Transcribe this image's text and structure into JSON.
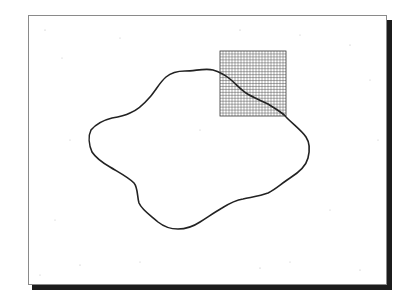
{
  "diagram": {
    "type": "region-with-sample-grid",
    "frame": {
      "x": 28,
      "y": 15,
      "width": 359,
      "height": 270,
      "border_color": "#8a8a8a",
      "shadow_color": "#1c1c1c"
    },
    "region": {
      "label": "irregular-region-outline",
      "stroke_color": "#222222",
      "stroke_width": 1.6,
      "path": "M213,70 C205,68 195,71 185,71 C178,71 172,72 166,77 C160,82 156,90 150,97 C144,104 138,110 130,113 C124,116 118,117 112,118 C104,120 96,124 91,130 C88,136 89,145 92,152 C96,158 103,163 110,167 C118,172 128,177 134,183 C138,188 137,196 139,203 C142,210 150,215 158,222 C163,226 170,229 178,229 C186,229 194,226 200,222 C208,217 215,212 222,208 C230,203 236,200 243,199 C252,197 260,196 268,193 C276,189 282,183 290,178 C298,173 306,166 308,158 C310,150 310,143 306,137 C302,131 294,125 287,118 C284,115 283,113 284,115 C280,111 274,108 268,104 C260,100 252,97 246,93 C240,89 236,84 230,79 C225,75 220,72 213,70 Z"
    },
    "grid": {
      "label": "sampling-grid",
      "x": 220,
      "y": 51,
      "width": 66,
      "height": 65,
      "cells": 22,
      "line_color": "#444444",
      "border_color": "#333333"
    }
  }
}
